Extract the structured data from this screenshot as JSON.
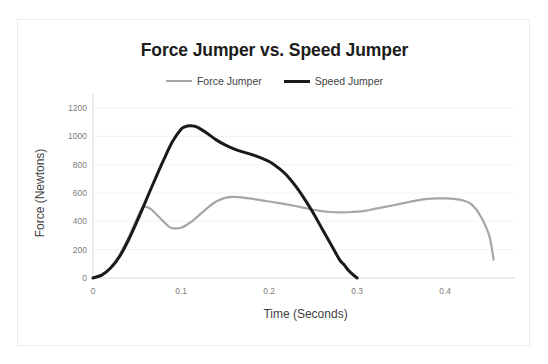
{
  "chart_data": {
    "type": "line",
    "title": "Force Jumper vs. Speed Jumper",
    "xlabel": "Time (Seconds)",
    "ylabel": "Force (Newtons)",
    "xlim": [
      0,
      0.46
    ],
    "ylim": [
      0,
      1200
    ],
    "xticks": [
      0,
      0.1,
      0.2,
      0.3,
      0.4
    ],
    "xtick_labels": [
      "0",
      "0.1",
      "0.2",
      "0.3",
      "0.4"
    ],
    "yticks": [
      0,
      200,
      400,
      600,
      800,
      1000,
      1200
    ],
    "ytick_labels": [
      "0",
      "200",
      "400",
      "600",
      "800",
      "1000",
      "1200"
    ],
    "grid": "horizontal",
    "legend_position": "top",
    "series": [
      {
        "name": "Force Jumper",
        "color": "#a6a6a6",
        "width": 2.2,
        "x": [
          0.0,
          0.01,
          0.02,
          0.03,
          0.04,
          0.05,
          0.057,
          0.065,
          0.075,
          0.085,
          0.09,
          0.1,
          0.11,
          0.12,
          0.13,
          0.14,
          0.15,
          0.16,
          0.17,
          0.18,
          0.19,
          0.2,
          0.21,
          0.22,
          0.23,
          0.24,
          0.25,
          0.26,
          0.27,
          0.28,
          0.29,
          0.3,
          0.31,
          0.32,
          0.33,
          0.34,
          0.35,
          0.36,
          0.37,
          0.38,
          0.39,
          0.4,
          0.41,
          0.42,
          0.43,
          0.44,
          0.45,
          0.455
        ],
        "y": [
          0,
          25,
          75,
          160,
          280,
          420,
          500,
          490,
          430,
          370,
          352,
          355,
          390,
          440,
          495,
          540,
          566,
          572,
          568,
          560,
          550,
          540,
          530,
          520,
          508,
          495,
          482,
          472,
          466,
          463,
          464,
          468,
          476,
          488,
          500,
          512,
          525,
          538,
          550,
          558,
          562,
          562,
          558,
          548,
          520,
          440,
          300,
          130
        ]
      },
      {
        "name": "Speed Jumper",
        "color": "#1a1a1a",
        "width": 3,
        "x": [
          0.0,
          0.01,
          0.02,
          0.03,
          0.04,
          0.05,
          0.06,
          0.07,
          0.08,
          0.09,
          0.1,
          0.105,
          0.11,
          0.115,
          0.12,
          0.13,
          0.14,
          0.15,
          0.16,
          0.17,
          0.18,
          0.19,
          0.2,
          0.21,
          0.215,
          0.22,
          0.23,
          0.24,
          0.25,
          0.26,
          0.27,
          0.28,
          0.285,
          0.29,
          0.295,
          0.3
        ],
        "y": [
          0,
          20,
          70,
          150,
          265,
          400,
          545,
          690,
          830,
          960,
          1050,
          1068,
          1075,
          1072,
          1060,
          1020,
          975,
          940,
          912,
          890,
          872,
          850,
          822,
          780,
          755,
          725,
          650,
          560,
          460,
          350,
          240,
          130,
          95,
          55,
          25,
          0
        ]
      }
    ]
  },
  "plot_geometry": {
    "left": 75,
    "top": 88,
    "right": 480,
    "bottom": 258
  }
}
